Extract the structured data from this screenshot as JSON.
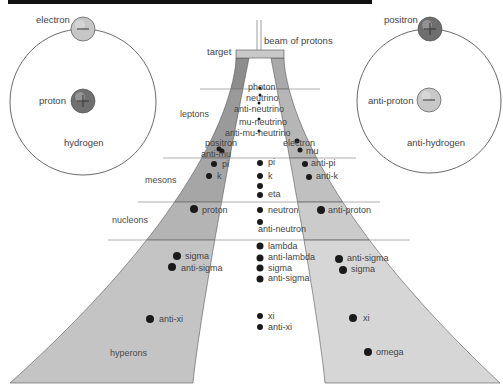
{
  "top_bar": {
    "x": 8,
    "y": 0,
    "width": 364,
    "height": 4,
    "color": "#111111"
  },
  "colors": {
    "left_band": [
      "#8d8d8d",
      "#9a9a9a",
      "#a6a6a6",
      "#b4b4b4",
      "#c4c4c4"
    ],
    "right_band": [
      "#a9a9a9",
      "#b6b6b6",
      "#c0c0c0",
      "#cbcbcb",
      "#d6d6d6"
    ],
    "divider": "#9a9a9a",
    "dot": "#1a1a1a",
    "orbit": "#444444",
    "target": "#c8c8c8"
  },
  "atoms": [
    {
      "name": "hydrogen",
      "label": "hydrogen",
      "cx": 83,
      "cy": 102,
      "r": 73,
      "label_pos": {
        "x": 64,
        "y": 138
      },
      "orbiting": {
        "label": "electron",
        "sign": "minus",
        "cx": 83,
        "cy": 29,
        "fill": "#c6c6c6",
        "label_pos": {
          "x": 36,
          "y": 15
        }
      },
      "nucleus": {
        "label": "proton",
        "sign": "plus",
        "cx": 83,
        "cy": 101,
        "fill": "#707070",
        "label_pos": {
          "x": 39,
          "y": 96
        }
      }
    },
    {
      "name": "anti-hydrogen",
      "label": "anti-hydrogen",
      "cx": 429,
      "cy": 101,
      "r": 72,
      "label_pos": {
        "x": 407,
        "y": 138
      },
      "orbiting": {
        "label": "positron",
        "sign": "plus",
        "cx": 430,
        "cy": 29,
        "fill": "#6e6e6e",
        "label_pos": {
          "x": 384,
          "y": 15
        }
      },
      "nucleus": {
        "label": "anti-proton",
        "sign": "minus",
        "cx": 429,
        "cy": 100,
        "fill": "#c8c8c8",
        "label_pos": {
          "x": 368,
          "y": 96
        }
      }
    }
  ],
  "beam": {
    "label": "beam of protons",
    "label_pos": {
      "x": 264,
      "y": 36
    },
    "x1": 257,
    "x2": 261,
    "y_top": 20,
    "y_bottom": 50
  },
  "target": {
    "label": "target",
    "label_pos": {
      "x": 207,
      "y": 47
    },
    "x": 236,
    "y": 50,
    "width": 48,
    "height": 8
  },
  "dividers": [
    {
      "y": 89,
      "x1": 200,
      "x2": 320
    },
    {
      "y": 158,
      "x1": 163,
      "x2": 356
    },
    {
      "y": 202,
      "x1": 138,
      "x2": 380
    },
    {
      "y": 240,
      "x1": 108,
      "x2": 410
    }
  ],
  "categories": [
    {
      "label": "leptons",
      "x": 180,
      "y": 109
    },
    {
      "label": "mesons",
      "x": 145,
      "y": 175
    },
    {
      "label": "nucleons",
      "x": 112,
      "y": 215
    },
    {
      "label": "hyperons",
      "x": 110,
      "y": 348
    }
  ],
  "particles": {
    "left": [
      {
        "label": "positron",
        "dot": [
          222,
          151
        ],
        "r": 2.5,
        "lx": 205,
        "ly": 138
      },
      {
        "label": "anti-mu",
        "dot": [
          219,
          149
        ],
        "r": 2.5,
        "lx": 201,
        "ly": 149
      },
      {
        "label": "pi",
        "dot": [
          214,
          164
        ],
        "r": 3,
        "lx": 222,
        "ly": 159
      },
      {
        "label": "k",
        "dot": [
          209,
          176
        ],
        "r": 3,
        "lx": 217,
        "ly": 171
      },
      {
        "label": "proton",
        "dot": [
          194,
          209
        ],
        "r": 4,
        "lx": 202,
        "ly": 205
      },
      {
        "label": "sigma",
        "dot": [
          177,
          256
        ],
        "r": 4,
        "lx": 185,
        "ly": 251
      },
      {
        "label": "anti-sigma",
        "dot": [
          172,
          267
        ],
        "r": 4,
        "lx": 181,
        "ly": 263
      },
      {
        "label": "anti-xi",
        "dot": [
          150,
          319
        ],
        "r": 4,
        "lx": 159,
        "ly": 314
      }
    ],
    "center": [
      {
        "label": "photon",
        "dot": [
          260,
          88
        ],
        "r": 1.5,
        "lx": 248,
        "ly": 82
      },
      {
        "label": "neutrino",
        "dot": [
          260,
          95
        ],
        "r": 1.5,
        "lx": 246,
        "ly": 93
      },
      {
        "label": "anti-neutrino",
        "dot": [
          259,
          103
        ],
        "r": 1.5,
        "lx": 234,
        "ly": 104
      },
      {
        "label": "mu-neutrino",
        "dot": [
          259,
          119
        ],
        "r": 1.5,
        "lx": 239,
        "ly": 117
      },
      {
        "label": "anti-mu-neutrino",
        "dot": [
          259,
          131
        ],
        "r": 1.5,
        "lx": 225,
        "ly": 128
      },
      {
        "label": "pi",
        "dot": [
          260,
          163
        ],
        "r": 3,
        "lx": 268,
        "ly": 157
      },
      {
        "label": "k",
        "dot": [
          260,
          176
        ],
        "r": 3,
        "lx": 268,
        "ly": 171
      },
      {
        "label": "",
        "dot": [
          260,
          186
        ],
        "r": 3,
        "lx": 0,
        "ly": 0
      },
      {
        "label": "eta",
        "dot": [
          260,
          195
        ],
        "r": 3,
        "lx": 268,
        "ly": 189
      },
      {
        "label": "neutron",
        "dot": [
          260,
          210
        ],
        "r": 3,
        "lx": 268,
        "ly": 205
      },
      {
        "label": "anti-neutron",
        "dot": [
          260,
          222
        ],
        "r": 3,
        "lx": 258,
        "ly": 224
      },
      {
        "label": "lambda",
        "dot": [
          260,
          246
        ],
        "r": 3.5,
        "lx": 268,
        "ly": 241
      },
      {
        "label": "anti-lambda",
        "dot": [
          260,
          258
        ],
        "r": 3.5,
        "lx": 268,
        "ly": 252
      },
      {
        "label": "sigma",
        "dot": [
          260,
          268
        ],
        "r": 3.5,
        "lx": 268,
        "ly": 263
      },
      {
        "label": "anti-sigma",
        "dot": [
          260,
          279
        ],
        "r": 3.5,
        "lx": 268,
        "ly": 273
      },
      {
        "label": "xi",
        "dot": [
          260,
          316
        ],
        "r": 3,
        "lx": 268,
        "ly": 311
      },
      {
        "label": "anti-xi",
        "dot": [
          260,
          327
        ],
        "r": 3,
        "lx": 268,
        "ly": 322
      }
    ],
    "right": [
      {
        "label": "electron",
        "dot": [
          297,
          141
        ],
        "r": 2.5,
        "lx": 283,
        "ly": 138
      },
      {
        "label": "mu",
        "dot": [
          300,
          150
        ],
        "r": 2.5,
        "lx": 306,
        "ly": 146
      },
      {
        "label": "anti-pi",
        "dot": [
          305,
          164
        ],
        "r": 3,
        "lx": 311,
        "ly": 158
      },
      {
        "label": "anti-k",
        "dot": [
          309,
          177
        ],
        "r": 3,
        "lx": 316,
        "ly": 171
      },
      {
        "label": "anti-proton",
        "dot": [
          321,
          210
        ],
        "r": 4,
        "lx": 328,
        "ly": 205
      },
      {
        "label": "anti-sigma",
        "dot": [
          339,
          259
        ],
        "r": 4,
        "lx": 347,
        "ly": 253
      },
      {
        "label": "sigma",
        "dot": [
          343,
          270
        ],
        "r": 4,
        "lx": 351,
        "ly": 264
      },
      {
        "label": "xi",
        "dot": [
          353,
          318
        ],
        "r": 4,
        "lx": 363,
        "ly": 313
      },
      {
        "label": "omega",
        "dot": [
          368,
          352
        ],
        "r": 4,
        "lx": 376,
        "ly": 347
      }
    ]
  }
}
